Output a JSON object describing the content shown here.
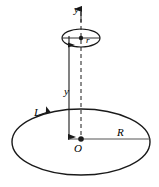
{
  "figure": {
    "stroke_color": "#1a1a1a",
    "background_color": "#ffffff",
    "labels": {
      "y_axis": "y",
      "small_radius": "r",
      "height": "y",
      "current": "I",
      "big_radius": "R",
      "origin": "O"
    },
    "geometry": {
      "big_ellipse": {
        "cx": 81,
        "cy": 142,
        "rx": 69,
        "ry": 33
      },
      "small_ellipse": {
        "cx": 81,
        "cy": 38,
        "rx": 19,
        "ry": 9
      },
      "axis_dashed_x": 81,
      "axis_dashed_y_top": 12,
      "axis_dashed_y_bottom": 139,
      "measure_line_x": 69,
      "measure_line_y_top": 44,
      "measure_line_y_bottom": 137,
      "radius_line_y": 139,
      "radius_line_x_start": 81,
      "radius_line_x_end": 150,
      "origin_dot": {
        "cx": 81,
        "cy": 139,
        "r": 2.6
      },
      "small_center_dot": {
        "cx": 81,
        "cy": 38,
        "r": 2.2
      }
    }
  }
}
